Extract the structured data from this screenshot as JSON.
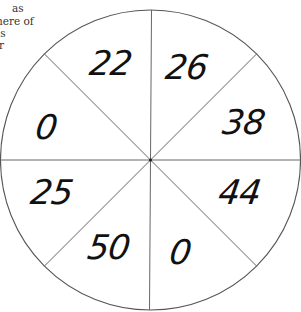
{
  "caption": {
    "lines": [
      "as",
      "here of",
      "as",
      "r"
    ]
  },
  "wheel": {
    "sectors": 8,
    "stroke_color": "#555555",
    "background": "#ffffff",
    "numbers": {
      "top_left": "22",
      "top_right": "26",
      "right_upper": "38",
      "right_lower": "44",
      "bottom_right": "0",
      "bottom_left": "50",
      "left_lower": "25",
      "left_upper": "0"
    }
  }
}
